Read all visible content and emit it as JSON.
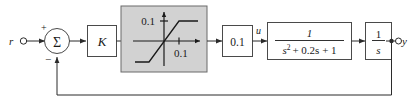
{
  "diagram": {
    "input_label": "r",
    "output_label": "y",
    "sum_symbol": "Σ",
    "sum_plus": "+",
    "sum_minus": "−",
    "gain_k_label": "K",
    "saturation": {
      "y_limit_label": "0.1",
      "x_limit_label": "0.1",
      "fill_color": "#d2d2d2",
      "border_color": "#6a6a6a"
    },
    "gain_small_label": "0.1",
    "signal_u_label": "u",
    "plant": {
      "numerator": "1",
      "denominator_base": "s",
      "denominator_exponent": "2",
      "denominator_rest": "+ 0.2s + 1",
      "denominator_full": "s² + 0.2s + 1"
    },
    "integrator": {
      "numerator": "1",
      "denominator": "s"
    },
    "colors": {
      "wire": "#2b2b2b",
      "block_border": "#4a4a4a",
      "block_fill": "#ffffff",
      "text": "#1a1a1a",
      "background": "#ffffff"
    }
  }
}
